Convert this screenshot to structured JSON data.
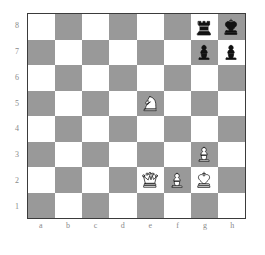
{
  "diagram": {
    "type": "chess-board-diagram",
    "orientation": "white-bottom",
    "board_colors": {
      "light_square": "#ffffff",
      "dark_square": "#999999",
      "border": "#3b3b3b",
      "label_text": "#8a8a8a"
    },
    "file_labels": [
      "a",
      "b",
      "c",
      "d",
      "e",
      "f",
      "g",
      "h"
    ],
    "rank_labels": [
      "8",
      "7",
      "6",
      "5",
      "4",
      "3",
      "2",
      "1"
    ],
    "squares": [
      {
        "id": "a8",
        "shade": "light",
        "piece": null
      },
      {
        "id": "b8",
        "shade": "dark",
        "piece": null
      },
      {
        "id": "c8",
        "shade": "light",
        "piece": null
      },
      {
        "id": "d8",
        "shade": "dark",
        "piece": null
      },
      {
        "id": "e8",
        "shade": "light",
        "piece": null
      },
      {
        "id": "f8",
        "shade": "dark",
        "piece": null
      },
      {
        "id": "g8",
        "shade": "light",
        "piece": "black-rook"
      },
      {
        "id": "h8",
        "shade": "dark",
        "piece": "black-king"
      },
      {
        "id": "a7",
        "shade": "dark",
        "piece": null
      },
      {
        "id": "b7",
        "shade": "light",
        "piece": null
      },
      {
        "id": "c7",
        "shade": "dark",
        "piece": null
      },
      {
        "id": "d7",
        "shade": "light",
        "piece": null
      },
      {
        "id": "e7",
        "shade": "dark",
        "piece": null
      },
      {
        "id": "f7",
        "shade": "light",
        "piece": null
      },
      {
        "id": "g7",
        "shade": "dark",
        "piece": "black-pawn"
      },
      {
        "id": "h7",
        "shade": "light",
        "piece": "black-pawn"
      },
      {
        "id": "a6",
        "shade": "light",
        "piece": null
      },
      {
        "id": "b6",
        "shade": "dark",
        "piece": null
      },
      {
        "id": "c6",
        "shade": "light",
        "piece": null
      },
      {
        "id": "d6",
        "shade": "dark",
        "piece": null
      },
      {
        "id": "e6",
        "shade": "light",
        "piece": null
      },
      {
        "id": "f6",
        "shade": "dark",
        "piece": null
      },
      {
        "id": "g6",
        "shade": "light",
        "piece": null
      },
      {
        "id": "h6",
        "shade": "dark",
        "piece": null
      },
      {
        "id": "a5",
        "shade": "dark",
        "piece": null
      },
      {
        "id": "b5",
        "shade": "light",
        "piece": null
      },
      {
        "id": "c5",
        "shade": "dark",
        "piece": null
      },
      {
        "id": "d5",
        "shade": "light",
        "piece": null
      },
      {
        "id": "e5",
        "shade": "dark",
        "piece": "white-knight"
      },
      {
        "id": "f5",
        "shade": "light",
        "piece": null
      },
      {
        "id": "g5",
        "shade": "dark",
        "piece": null
      },
      {
        "id": "h5",
        "shade": "light",
        "piece": null
      },
      {
        "id": "a4",
        "shade": "light",
        "piece": null
      },
      {
        "id": "b4",
        "shade": "dark",
        "piece": null
      },
      {
        "id": "c4",
        "shade": "light",
        "piece": null
      },
      {
        "id": "d4",
        "shade": "dark",
        "piece": null
      },
      {
        "id": "e4",
        "shade": "light",
        "piece": null
      },
      {
        "id": "f4",
        "shade": "dark",
        "piece": null
      },
      {
        "id": "g4",
        "shade": "light",
        "piece": null
      },
      {
        "id": "h4",
        "shade": "dark",
        "piece": null
      },
      {
        "id": "a3",
        "shade": "dark",
        "piece": null
      },
      {
        "id": "b3",
        "shade": "light",
        "piece": null
      },
      {
        "id": "c3",
        "shade": "dark",
        "piece": null
      },
      {
        "id": "d3",
        "shade": "light",
        "piece": null
      },
      {
        "id": "e3",
        "shade": "dark",
        "piece": null
      },
      {
        "id": "f3",
        "shade": "light",
        "piece": null
      },
      {
        "id": "g3",
        "shade": "dark",
        "piece": "white-pawn"
      },
      {
        "id": "h3",
        "shade": "light",
        "piece": null
      },
      {
        "id": "a2",
        "shade": "light",
        "piece": null
      },
      {
        "id": "b2",
        "shade": "dark",
        "piece": null
      },
      {
        "id": "c2",
        "shade": "light",
        "piece": null
      },
      {
        "id": "d2",
        "shade": "dark",
        "piece": null
      },
      {
        "id": "e2",
        "shade": "light",
        "piece": "white-queen"
      },
      {
        "id": "f2",
        "shade": "dark",
        "piece": "white-pawn"
      },
      {
        "id": "g2",
        "shade": "light",
        "piece": "white-king"
      },
      {
        "id": "h2",
        "shade": "dark",
        "piece": null
      },
      {
        "id": "a1",
        "shade": "dark",
        "piece": null
      },
      {
        "id": "b1",
        "shade": "light",
        "piece": null
      },
      {
        "id": "c1",
        "shade": "dark",
        "piece": null
      },
      {
        "id": "d1",
        "shade": "light",
        "piece": null
      },
      {
        "id": "e1",
        "shade": "dark",
        "piece": null
      },
      {
        "id": "f1",
        "shade": "light",
        "piece": null
      },
      {
        "id": "g1",
        "shade": "dark",
        "piece": null
      },
      {
        "id": "h1",
        "shade": "light",
        "piece": null
      }
    ],
    "pieces_placed": [
      {
        "square": "g8",
        "piece": "black-rook"
      },
      {
        "square": "h8",
        "piece": "black-king"
      },
      {
        "square": "g7",
        "piece": "black-pawn"
      },
      {
        "square": "h7",
        "piece": "black-pawn"
      },
      {
        "square": "e5",
        "piece": "white-knight"
      },
      {
        "square": "g3",
        "piece": "white-pawn"
      },
      {
        "square": "e2",
        "piece": "white-queen"
      },
      {
        "square": "f2",
        "piece": "white-pawn"
      },
      {
        "square": "g2",
        "piece": "white-king"
      }
    ]
  }
}
